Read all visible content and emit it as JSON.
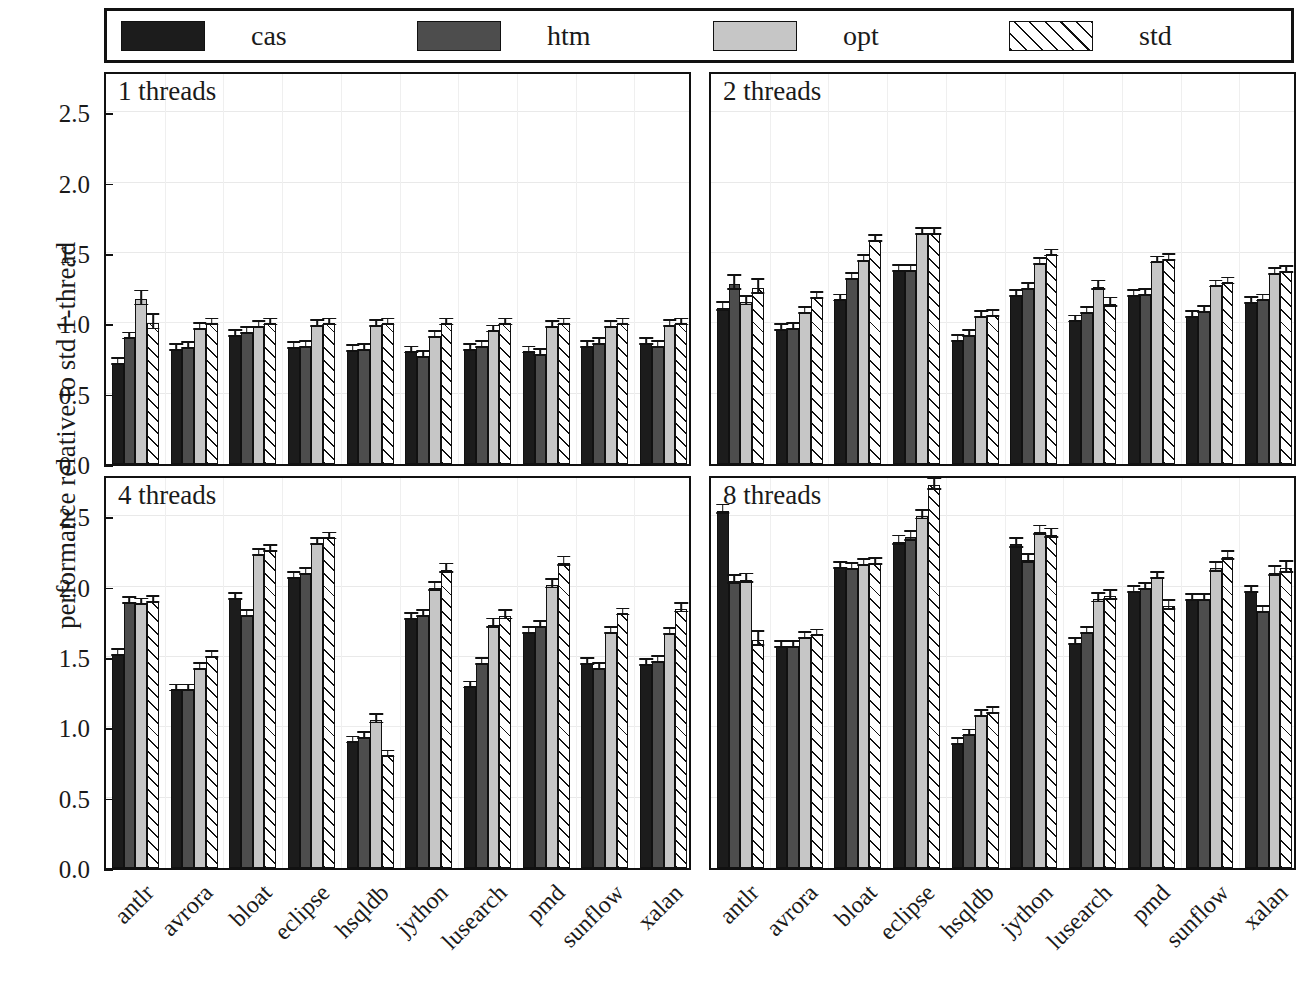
{
  "legend": {
    "entries": [
      {
        "label": "cas",
        "swatch": "solid-near-black",
        "color": "#1c1c1c"
      },
      {
        "label": "htm",
        "swatch": "solid-dark-gray",
        "color": "#4d4d4d"
      },
      {
        "label": "opt",
        "swatch": "solid-light-gray",
        "color": "#c6c6c6"
      },
      {
        "label": "std",
        "swatch": "white-diagonal-hatch",
        "color": "#ffffff"
      }
    ]
  },
  "axes": {
    "ylabel": "performance relative to std 1-thread",
    "yticks": [
      "0.0",
      "0.5",
      "1.0",
      "1.5",
      "2.0",
      "2.5"
    ],
    "ylim": [
      0.0,
      2.8
    ],
    "grid": true,
    "baseline": "1.0"
  },
  "chart_data": {
    "type": "bar",
    "title": "",
    "xlabel": "",
    "ylabel": "performance relative to std 1-thread",
    "ylim": [
      0.0,
      2.8
    ],
    "yticks": [
      0.0,
      0.5,
      1.0,
      1.5,
      2.0,
      2.5
    ],
    "grid": true,
    "legend_position": "top",
    "categories": [
      "antlr",
      "avrora",
      "bloat",
      "eclipse",
      "hsqldb",
      "jython",
      "lusearch",
      "pmd",
      "sunflow",
      "xalan"
    ],
    "series_names": [
      "cas",
      "htm",
      "opt",
      "std"
    ],
    "panels": [
      {
        "title": "1 threads",
        "series": [
          {
            "name": "cas",
            "values": [
              0.72,
              0.82,
              0.92,
              0.83,
              0.81,
              0.8,
              0.82,
              0.8,
              0.84,
              0.86
            ],
            "err": [
              0.02,
              0.01,
              0.01,
              0.01,
              0.01,
              0.02,
              0.01,
              0.02,
              0.01,
              0.01
            ]
          },
          {
            "name": "htm",
            "values": [
              0.9,
              0.83,
              0.94,
              0.84,
              0.82,
              0.77,
              0.84,
              0.78,
              0.86,
              0.84
            ],
            "err": [
              0.02,
              0.01,
              0.01,
              0.01,
              0.01,
              0.02,
              0.01,
              0.01,
              0.01,
              0.01
            ]
          },
          {
            "name": "opt",
            "values": [
              1.17,
              0.97,
              0.98,
              0.99,
              0.99,
              0.91,
              0.95,
              0.98,
              0.98,
              0.99
            ],
            "err": [
              0.05,
              0.01,
              0.01,
              0.01,
              0.01,
              0.02,
              0.01,
              0.01,
              0.01,
              0.01
            ]
          },
          {
            "name": "std",
            "values": [
              1.0,
              1.0,
              1.0,
              1.0,
              1.0,
              1.0,
              1.0,
              1.0,
              1.0,
              1.0
            ],
            "err": [
              0.05,
              0.01,
              0.01,
              0.01,
              0.01,
              0.02,
              0.01,
              0.01,
              0.01,
              0.01
            ]
          }
        ]
      },
      {
        "title": "2 threads",
        "series": [
          {
            "name": "cas",
            "values": [
              1.11,
              0.96,
              1.17,
              1.38,
              0.88,
              1.2,
              1.02,
              1.2,
              1.05,
              1.15
            ],
            "err": [
              0.03,
              0.01,
              0.01,
              0.02,
              0.01,
              0.02,
              0.02,
              0.01,
              0.01,
              0.01
            ]
          },
          {
            "name": "htm",
            "values": [
              1.28,
              0.97,
              1.32,
              1.38,
              0.92,
              1.25,
              1.08,
              1.21,
              1.09,
              1.17
            ],
            "err": [
              0.05,
              0.01,
              0.01,
              0.02,
              0.01,
              0.02,
              0.02,
              0.01,
              0.01,
              0.01
            ]
          },
          {
            "name": "opt",
            "values": [
              1.15,
              1.08,
              1.45,
              1.64,
              1.05,
              1.43,
              1.26,
              1.44,
              1.27,
              1.36
            ],
            "err": [
              0.03,
              0.01,
              0.02,
              0.02,
              0.01,
              0.02,
              0.03,
              0.02,
              0.01,
              0.02
            ]
          },
          {
            "name": "std",
            "values": [
              1.25,
              1.19,
              1.59,
              1.64,
              1.06,
              1.49,
              1.14,
              1.46,
              1.29,
              1.37
            ],
            "err": [
              0.05,
              0.01,
              0.02,
              0.02,
              0.01,
              0.02,
              0.03,
              0.02,
              0.01,
              0.02
            ]
          }
        ]
      },
      {
        "title": "4 threads",
        "series": [
          {
            "name": "cas",
            "values": [
              1.52,
              1.27,
              1.92,
              2.07,
              0.9,
              1.78,
              1.29,
              1.68,
              1.46,
              1.45
            ],
            "err": [
              0.02,
              0.02,
              0.02,
              0.02,
              0.01,
              0.02,
              0.02,
              0.02,
              0.02,
              0.02
            ]
          },
          {
            "name": "htm",
            "values": [
              1.89,
              1.27,
              1.8,
              2.1,
              0.93,
              1.8,
              1.46,
              1.72,
              1.42,
              1.47
            ],
            "err": [
              0.02,
              0.02,
              0.02,
              0.02,
              0.01,
              0.02,
              0.02,
              0.02,
              0.02,
              0.02
            ]
          },
          {
            "name": "opt",
            "values": [
              1.88,
              1.42,
              2.23,
              2.31,
              1.05,
              1.99,
              1.73,
              2.01,
              1.68,
              1.67
            ],
            "err": [
              0.02,
              0.02,
              0.02,
              0.02,
              0.03,
              0.03,
              0.03,
              0.03,
              0.02,
              0.02
            ]
          },
          {
            "name": "std",
            "values": [
              1.9,
              1.51,
              2.26,
              2.35,
              0.8,
              2.12,
              1.79,
              2.17,
              1.81,
              1.84
            ],
            "err": [
              0.02,
              0.02,
              0.02,
              0.02,
              0.02,
              0.03,
              0.03,
              0.03,
              0.02,
              0.03
            ]
          }
        ]
      },
      {
        "title": "8 threads",
        "series": [
          {
            "name": "cas",
            "values": [
              2.54,
              1.58,
              2.14,
              2.32,
              0.89,
              2.3,
              1.6,
              1.97,
              1.91,
              1.97
            ],
            "err": [
              0.03,
              0.02,
              0.02,
              0.03,
              0.01,
              0.03,
              0.02,
              0.02,
              0.02,
              0.02
            ]
          },
          {
            "name": "htm",
            "values": [
              2.04,
              1.58,
              2.13,
              2.35,
              0.95,
              2.19,
              1.68,
              1.99,
              1.91,
              1.83
            ],
            "err": [
              0.03,
              0.02,
              0.02,
              0.03,
              0.01,
              0.03,
              0.02,
              0.02,
              0.02,
              0.02
            ]
          },
          {
            "name": "opt",
            "values": [
              2.05,
              1.64,
              2.16,
              2.5,
              1.09,
              2.39,
              1.91,
              2.07,
              2.13,
              2.1
            ],
            "err": [
              0.03,
              0.02,
              0.02,
              0.03,
              0.01,
              0.03,
              0.03,
              0.02,
              0.03,
              0.03
            ]
          },
          {
            "name": "std",
            "values": [
              1.62,
              1.66,
              2.17,
              2.72,
              1.11,
              2.37,
              1.93,
              1.86,
              2.21,
              2.13
            ],
            "err": [
              0.05,
              0.02,
              0.02,
              0.04,
              0.01,
              0.03,
              0.03,
              0.03,
              0.03,
              0.04
            ]
          }
        ]
      }
    ]
  }
}
